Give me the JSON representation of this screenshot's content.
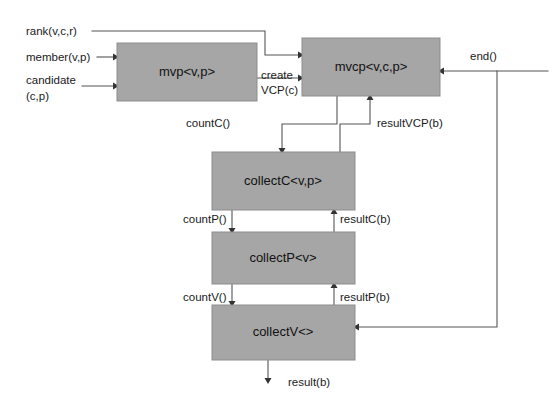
{
  "diagram": {
    "background_color": "#ffffff",
    "box_fill_color": "#a6a6a6",
    "wire_color": "#555555",
    "boxes": [
      {
        "id": "mvp",
        "label": "mvp<v,p>",
        "x": 117,
        "y": 43,
        "w": 140,
        "h": 58
      },
      {
        "id": "mvcp",
        "label": "mvcp<v,c,p>",
        "x": 302,
        "y": 38,
        "w": 138,
        "h": 58
      },
      {
        "id": "collectC",
        "label": "collectC<v,p>",
        "x": 212,
        "y": 152,
        "w": 143,
        "h": 58
      },
      {
        "id": "collectP",
        "label": "collectP<v>",
        "x": 212,
        "y": 232,
        "w": 143,
        "h": 52
      },
      {
        "id": "collectV",
        "label": "collectV<>",
        "x": 212,
        "y": 305,
        "w": 143,
        "h": 55
      }
    ],
    "input_labels": [
      {
        "id": "rank",
        "text": "rank(v,c,r)",
        "x": 26,
        "y": 26
      },
      {
        "id": "member",
        "text": "member(v,p)",
        "x": 26,
        "y": 50
      },
      {
        "id": "candidate",
        "text": "candidate",
        "x": 26,
        "y": 79
      },
      {
        "id": "candidate2",
        "text": "(c,p)",
        "x": 26,
        "y": 95
      }
    ],
    "edge_labels": [
      {
        "id": "create-vcp-1",
        "text": "create",
        "x": 261,
        "y": 74
      },
      {
        "id": "create-vcp-2",
        "text": "VCP(c)",
        "x": 261,
        "y": 89
      },
      {
        "id": "end",
        "text": "end()",
        "x": 472,
        "y": 55
      },
      {
        "id": "countC",
        "text": "countC()",
        "x": 233,
        "y": 122
      },
      {
        "id": "resultVCP",
        "text": "resultVCP(b)",
        "x": 377,
        "y": 122
      },
      {
        "id": "countP",
        "text": "countP()",
        "x": 186,
        "y": 218
      },
      {
        "id": "resultC",
        "text": "resultC(b)",
        "x": 330,
        "y": 218
      },
      {
        "id": "countV",
        "text": "countV()",
        "x": 186,
        "y": 296
      },
      {
        "id": "resultP",
        "text": "resultP(b)",
        "x": 330,
        "y": 296
      },
      {
        "id": "result",
        "text": "result(b)",
        "x": 290,
        "y": 383
      }
    ]
  }
}
